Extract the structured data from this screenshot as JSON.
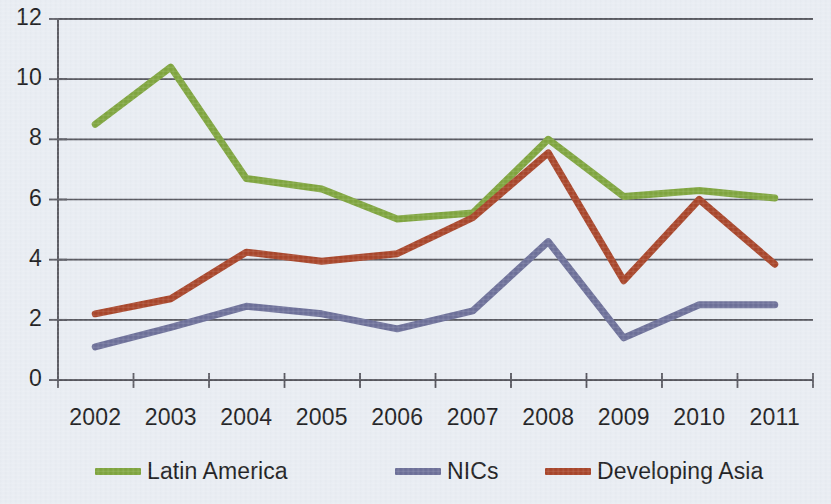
{
  "chart_data": {
    "type": "line",
    "title": "",
    "xlabel": "",
    "ylabel": "",
    "categories": [
      "2002",
      "2003",
      "2004",
      "2005",
      "2006",
      "2007",
      "2008",
      "2009",
      "2010",
      "2011"
    ],
    "ylim": [
      0,
      12
    ],
    "ytick_labels": [
      "0",
      "2",
      "4",
      "6",
      "8",
      "10",
      "12"
    ],
    "ytick_values": [
      0,
      2,
      4,
      6,
      8,
      10,
      12
    ],
    "grid": "horizontal",
    "legend_position": "bottom",
    "series": [
      {
        "name": "Latin America",
        "color": "#7fa53e",
        "values": [
          8.5,
          10.4,
          6.7,
          6.35,
          5.35,
          5.55,
          8.0,
          6.1,
          6.3,
          6.05
        ]
      },
      {
        "name": "NICs",
        "color": "#6d7099",
        "values": [
          1.1,
          1.75,
          2.45,
          2.2,
          1.7,
          2.3,
          4.6,
          1.4,
          2.5,
          2.5
        ]
      },
      {
        "name": "Developing Asia",
        "color": "#a8452a",
        "values": [
          2.2,
          2.7,
          4.25,
          3.95,
          4.2,
          5.4,
          7.55,
          3.3,
          6.0,
          3.85
        ]
      }
    ]
  },
  "axis": {
    "line_color": "#54545c",
    "grid_color": "#4a4a52"
  },
  "canvas": {
    "background": "#e9edf3"
  }
}
